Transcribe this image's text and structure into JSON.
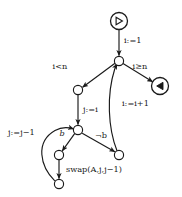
{
  "diagram": {
    "kind": "control-flow-graph",
    "stroke_color": "#1a1a1a",
    "background_color": "#ffffff",
    "nodes": [
      {
        "id": "start",
        "label": "",
        "glyph": "play-right-triangle",
        "shape": "double-circle",
        "x": 119,
        "y": 21,
        "r": 8.5
      },
      {
        "id": "n1",
        "label": "",
        "glyph": "",
        "shape": "circle",
        "x": 119,
        "y": 61,
        "r": 4.6
      },
      {
        "id": "end",
        "label": "",
        "glyph": "play-left-triangle",
        "shape": "double-circle",
        "x": 160,
        "y": 86,
        "r": 8.5
      },
      {
        "id": "n2",
        "label": "",
        "glyph": "",
        "shape": "circle",
        "x": 78,
        "y": 90,
        "r": 4.6
      },
      {
        "id": "n3",
        "label": "",
        "glyph": "",
        "shape": "circle",
        "x": 78,
        "y": 130,
        "r": 4.6
      },
      {
        "id": "n4",
        "label": "",
        "glyph": "",
        "shape": "circle",
        "x": 119,
        "y": 155,
        "r": 4.6
      },
      {
        "id": "n5",
        "label": "",
        "glyph": "",
        "shape": "circle",
        "x": 59,
        "y": 155,
        "r": 4.6
      },
      {
        "id": "n6",
        "label": "",
        "glyph": "",
        "shape": "circle",
        "x": 59,
        "y": 184,
        "r": 4.6
      }
    ],
    "edges": [
      {
        "id": "e-start-n1",
        "from": "start",
        "to": "n1",
        "label": "i:=1",
        "label_x": 124,
        "label_y": 41,
        "italic": false
      },
      {
        "id": "e-n1-n2",
        "from": "n1",
        "to": "n2",
        "label": "i<n",
        "label_x": 60,
        "label_y": 67,
        "italic": false
      },
      {
        "id": "e-n1-end",
        "from": "n1",
        "to": "end",
        "label": "i≥n",
        "label_x": 140,
        "label_y": 67,
        "italic": false
      },
      {
        "id": "e-n2-n3",
        "from": "n2",
        "to": "n3",
        "label": "j:=i",
        "label_x": 83,
        "label_y": 110,
        "italic": false
      },
      {
        "id": "e-n3-n5",
        "from": "n3",
        "to": "n5",
        "label": "b",
        "label_x": 62,
        "label_y": 134,
        "italic": true
      },
      {
        "id": "e-n3-n4",
        "from": "n3",
        "to": "n4",
        "label": "¬b",
        "label_x": 101,
        "label_y": 136,
        "italic": false
      },
      {
        "id": "e-n5-n6",
        "from": "n5",
        "to": "n6",
        "label": "swap(A,j,j−1)",
        "label_x": 66,
        "label_y": 170,
        "italic": false
      },
      {
        "id": "e-n6-n3",
        "from": "n6",
        "to": "n3",
        "label": "j:=j−1",
        "label_x": 8,
        "label_y": 133,
        "italic": false
      },
      {
        "id": "e-n4-n1",
        "from": "n4",
        "to": "n1",
        "label": "i:=i+1",
        "label_x": 122,
        "label_y": 104,
        "italic": false
      }
    ]
  }
}
